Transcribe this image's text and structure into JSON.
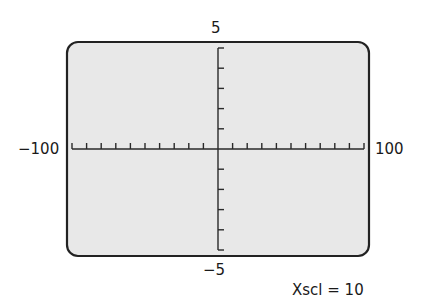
{
  "window": {
    "xmin_label": "−100",
    "xmax_label": "100",
    "ymax_label": "5",
    "ymin_label": "−5",
    "xscl_label": "Xscl = 10"
  },
  "colors": {
    "screen_fill": "#e8e8e8",
    "border": "#222222",
    "axis": "#2a2a2a",
    "text": "#1a1a1a"
  },
  "chart_data": {
    "type": "graphing-window",
    "xmin": -100,
    "xmax": 100,
    "xscl": 10,
    "ymin": -5,
    "ymax": 5,
    "yscl": 1,
    "x_tick_count": 21,
    "y_tick_count": 11,
    "annotations": [
      "Xscl = 10"
    ]
  }
}
